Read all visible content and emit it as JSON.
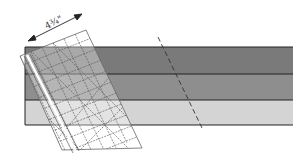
{
  "diagram": {
    "dimension_label": "4¾\"",
    "bands": [
      {
        "name": "top-strip",
        "color": "#7a7a7a"
      },
      {
        "name": "middle-strip",
        "color": "#8e8e8e"
      },
      {
        "name": "bottom-strip",
        "color": "#d4d4d4"
      }
    ],
    "colors": {
      "band_border": "#222222",
      "ruler_grid": "#555555",
      "ruler_fill": "#ffffff",
      "dashed_cut_line": "#333333",
      "arrow": "#222222"
    }
  }
}
